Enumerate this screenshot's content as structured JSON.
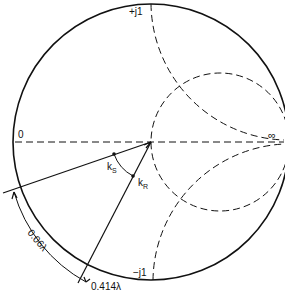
{
  "diagram": {
    "type": "smith-chart",
    "labels": {
      "zero": "0",
      "infinity": "∞",
      "plus_j1": "+j1",
      "minus_j1": "−j1",
      "ks": "k",
      "ks_sub": "S",
      "kr": "k",
      "kr_sub": "R",
      "arc_distance": "0.06λ",
      "wavelength_mark": "0.414λ"
    },
    "colors": {
      "line": "#111111",
      "background": "#ffffff"
    }
  }
}
